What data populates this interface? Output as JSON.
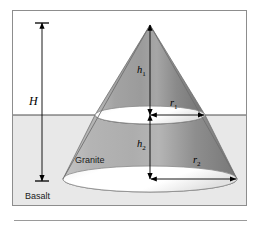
{
  "figure": {
    "labels": {
      "total_height": "H",
      "upper_height": "h",
      "upper_height_sub": "1",
      "lower_height": "h",
      "lower_height_sub": "2",
      "upper_radius": "r",
      "upper_radius_sub": "1",
      "lower_radius": "r",
      "lower_radius_sub": "2",
      "upper_material": "Granite",
      "lower_material": "Basalt"
    },
    "colors": {
      "frame_border": "#8d8d8d",
      "upper_background": "#ffffff",
      "lower_background": "#e8e8e8",
      "cone_light": "#c9c9c9",
      "cone_mid": "#a8a8a8",
      "cone_dark": "#7e7e7e",
      "ellipse_fill": "#ffffff",
      "outline": "#6a6a6a",
      "dimension_line": "#000000",
      "text": "#1a1a1a",
      "caption_rule": "#9a9a9a"
    },
    "geometry": {
      "apex_x": 137,
      "apex_y": 14,
      "ground_line_y": 104,
      "base_center_y": 168,
      "upper_ellipse_rx": 55,
      "upper_ellipse_ry": 9,
      "lower_ellipse_rx": 87,
      "lower_ellipse_ry": 13,
      "dimension_left_x": 28,
      "dimension_top_y": 12,
      "dimension_bottom_y": 170
    }
  }
}
